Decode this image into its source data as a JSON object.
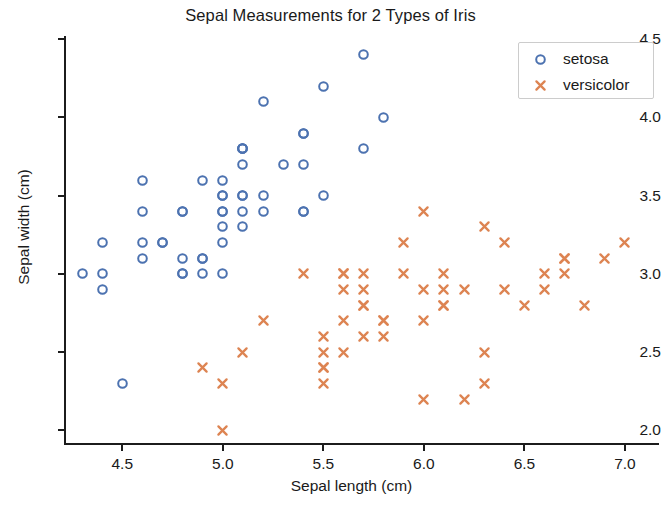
{
  "chart_data": {
    "type": "scatter",
    "title": "Sepal Measurements for 2 Types of Iris",
    "xlabel": "Sepal length (cm)",
    "ylabel": "Sepal width (cm)",
    "xlim": [
      4.22,
      7.06
    ],
    "ylim": [
      1.92,
      4.52
    ],
    "xticks": [
      "4.5",
      "5.0",
      "5.5",
      "6.0",
      "6.5",
      "7.0"
    ],
    "xtick_values": [
      4.5,
      5.0,
      5.5,
      6.0,
      6.5,
      7.0
    ],
    "yticks": [
      "2.0",
      "2.5",
      "3.0",
      "3.5",
      "4.0",
      "4.5"
    ],
    "ytick_values": [
      2.0,
      2.5,
      3.0,
      3.5,
      4.0,
      4.5
    ],
    "grid": false,
    "legend_position": "upper right",
    "colors": {
      "setosa": "#4C72B0",
      "versicolor": "#DD8452",
      "axis": "#1c1c1c",
      "text": "#1a1a1a",
      "background": "#ffffff",
      "legend_border": "#cccccc"
    },
    "series": [
      {
        "name": "setosa",
        "marker": "o",
        "color": "#4C72B0",
        "points": [
          [
            5.1,
            3.5
          ],
          [
            4.9,
            3.0
          ],
          [
            4.7,
            3.2
          ],
          [
            4.6,
            3.1
          ],
          [
            5.0,
            3.6
          ],
          [
            5.4,
            3.9
          ],
          [
            4.6,
            3.4
          ],
          [
            5.0,
            3.4
          ],
          [
            4.4,
            2.9
          ],
          [
            4.9,
            3.1
          ],
          [
            5.4,
            3.7
          ],
          [
            4.8,
            3.4
          ],
          [
            4.8,
            3.0
          ],
          [
            4.3,
            3.0
          ],
          [
            5.8,
            4.0
          ],
          [
            5.7,
            4.4
          ],
          [
            5.4,
            3.9
          ],
          [
            5.1,
            3.5
          ],
          [
            5.7,
            3.8
          ],
          [
            5.1,
            3.8
          ],
          [
            5.4,
            3.4
          ],
          [
            5.1,
            3.7
          ],
          [
            4.6,
            3.6
          ],
          [
            5.1,
            3.3
          ],
          [
            4.8,
            3.4
          ],
          [
            5.0,
            3.0
          ],
          [
            5.0,
            3.4
          ],
          [
            5.2,
            3.5
          ],
          [
            5.2,
            3.4
          ],
          [
            4.7,
            3.2
          ],
          [
            4.8,
            3.1
          ],
          [
            5.4,
            3.4
          ],
          [
            5.2,
            4.1
          ],
          [
            5.5,
            4.2
          ],
          [
            4.9,
            3.1
          ],
          [
            5.0,
            3.2
          ],
          [
            5.5,
            3.5
          ],
          [
            4.9,
            3.6
          ],
          [
            4.4,
            3.0
          ],
          [
            5.1,
            3.4
          ],
          [
            5.0,
            3.5
          ],
          [
            4.5,
            2.3
          ],
          [
            4.4,
            3.2
          ],
          [
            5.0,
            3.5
          ],
          [
            5.1,
            3.8
          ],
          [
            4.8,
            3.0
          ],
          [
            5.1,
            3.8
          ],
          [
            4.6,
            3.2
          ],
          [
            5.3,
            3.7
          ],
          [
            5.0,
            3.3
          ]
        ]
      },
      {
        "name": "versicolor",
        "marker": "x",
        "color": "#DD8452",
        "points": [
          [
            7.0,
            3.2
          ],
          [
            6.4,
            3.2
          ],
          [
            6.9,
            3.1
          ],
          [
            5.5,
            2.3
          ],
          [
            6.5,
            2.8
          ],
          [
            5.7,
            2.8
          ],
          [
            6.3,
            3.3
          ],
          [
            4.9,
            2.4
          ],
          [
            6.6,
            2.9
          ],
          [
            5.2,
            2.7
          ],
          [
            5.0,
            2.0
          ],
          [
            5.9,
            3.0
          ],
          [
            6.0,
            2.2
          ],
          [
            6.1,
            2.9
          ],
          [
            5.6,
            2.9
          ],
          [
            6.7,
            3.1
          ],
          [
            5.6,
            3.0
          ],
          [
            5.8,
            2.7
          ],
          [
            6.2,
            2.2
          ],
          [
            5.6,
            2.5
          ],
          [
            5.9,
            3.2
          ],
          [
            6.1,
            2.8
          ],
          [
            6.3,
            2.5
          ],
          [
            6.1,
            2.8
          ],
          [
            6.4,
            2.9
          ],
          [
            6.6,
            3.0
          ],
          [
            6.8,
            2.8
          ],
          [
            6.7,
            3.0
          ],
          [
            6.0,
            2.9
          ],
          [
            5.7,
            2.6
          ],
          [
            5.5,
            2.4
          ],
          [
            5.5,
            2.4
          ],
          [
            5.8,
            2.7
          ],
          [
            6.0,
            2.7
          ],
          [
            5.4,
            3.0
          ],
          [
            6.0,
            3.4
          ],
          [
            6.7,
            3.1
          ],
          [
            6.3,
            2.3
          ],
          [
            5.6,
            3.0
          ],
          [
            5.5,
            2.5
          ],
          [
            5.5,
            2.6
          ],
          [
            6.1,
            3.0
          ],
          [
            5.8,
            2.6
          ],
          [
            5.0,
            2.3
          ],
          [
            5.6,
            2.7
          ],
          [
            5.7,
            3.0
          ],
          [
            5.7,
            2.9
          ],
          [
            6.2,
            2.9
          ],
          [
            5.1,
            2.5
          ],
          [
            5.7,
            2.8
          ]
        ]
      }
    ]
  },
  "legend": {
    "entries": [
      {
        "label": "setosa",
        "marker": "circle-marker-icon"
      },
      {
        "label": "versicolor",
        "marker": "cross-marker-icon"
      }
    ]
  }
}
